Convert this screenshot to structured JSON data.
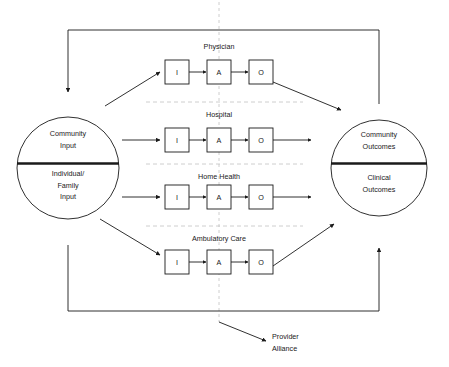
{
  "diagram": {
    "left_circle": {
      "name": "input-circle",
      "top_label_line1": "Community",
      "top_label_line2": "Input",
      "bottom_label_line1": "Individual/",
      "bottom_label_line2": "Family",
      "bottom_label_line3": "Input"
    },
    "right_circle": {
      "name": "outcome-circle",
      "top_label_line1": "Community",
      "top_label_line2": "Outcomes",
      "bottom_label_line1": "Clinical",
      "bottom_label_line2": "Outcomes"
    },
    "stages": [
      {
        "id": "physician",
        "title": "Physician",
        "boxes": [
          "I",
          "A",
          "O"
        ]
      },
      {
        "id": "hospital",
        "title": "Hospital",
        "boxes": [
          "I",
          "A",
          "O"
        ]
      },
      {
        "id": "home-health",
        "title": "Home Health",
        "boxes": [
          "I",
          "A",
          "O"
        ]
      },
      {
        "id": "ambulatory-care",
        "title": "Ambulatory Care",
        "boxes": [
          "I",
          "A",
          "O"
        ]
      }
    ],
    "annotation": {
      "line1": "Provider",
      "line2": "Alliance"
    },
    "colors": {
      "stroke": "#1a1a1a",
      "divider": "#1a1a1a",
      "dashed": "#b9b9b9",
      "background": "#ffffff",
      "text": "#1a1a1a"
    }
  }
}
